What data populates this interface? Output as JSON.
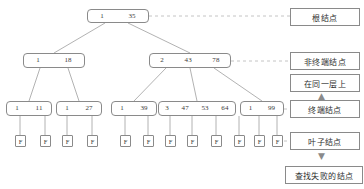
{
  "diagram": {
    "colors": {
      "node_border": "#8a8a8a",
      "edge": "#9a9a9a",
      "dashed": "#b0b0b0",
      "text": "#3b3b3b",
      "background": "#ffffff"
    },
    "root": {
      "id": "root",
      "cells": [
        "1",
        "35"
      ],
      "x": 87,
      "y": 9,
      "w": 62,
      "h": 14
    },
    "internal_nodes": [
      {
        "id": "n-left",
        "cells": [
          "1",
          "18"
        ],
        "x": 23,
        "y": 53,
        "w": 62,
        "h": 15
      },
      {
        "id": "n-right",
        "cells": [
          "2",
          "43",
          "78"
        ],
        "x": 149,
        "y": 53,
        "w": 82,
        "h": 15
      }
    ],
    "terminal_nodes": [
      {
        "id": "t1",
        "cells": [
          "1",
          "11"
        ],
        "x": 6,
        "y": 101,
        "w": 46,
        "h": 15
      },
      {
        "id": "t2",
        "cells": [
          "1",
          "27"
        ],
        "x": 56,
        "y": 101,
        "w": 46,
        "h": 15
      },
      {
        "id": "t3",
        "cells": [
          "1",
          "39"
        ],
        "x": 111,
        "y": 101,
        "w": 46,
        "h": 15
      },
      {
        "id": "t4",
        "cells": [
          "3",
          "47",
          "53",
          "64"
        ],
        "x": 158,
        "y": 101,
        "w": 78,
        "h": 15
      },
      {
        "id": "t5",
        "cells": [
          "1",
          "99"
        ],
        "x": 240,
        "y": 101,
        "w": 44,
        "h": 15
      }
    ],
    "leaf_label": "F",
    "leaves": [
      {
        "id": "f1",
        "x": 15,
        "y": 135
      },
      {
        "id": "f2",
        "x": 40,
        "y": 135
      },
      {
        "id": "f3",
        "x": 62,
        "y": 135
      },
      {
        "id": "f4",
        "x": 87,
        "y": 135
      },
      {
        "id": "f5",
        "x": 120,
        "y": 135
      },
      {
        "id": "f6",
        "x": 143,
        "y": 135
      },
      {
        "id": "f7",
        "x": 165,
        "y": 135
      },
      {
        "id": "f8",
        "x": 187,
        "y": 135
      },
      {
        "id": "f9",
        "x": 211,
        "y": 135
      },
      {
        "id": "f10",
        "x": 234,
        "y": 135
      },
      {
        "id": "f11",
        "x": 254,
        "y": 135
      },
      {
        "id": "f12",
        "x": 272,
        "y": 135
      }
    ],
    "annotations": [
      {
        "id": "ann-root",
        "text": "根结点",
        "x": 290,
        "y": 8,
        "w": 70,
        "h": 18
      },
      {
        "id": "ann-nonterm",
        "text": "非终端结点",
        "x": 290,
        "y": 52,
        "w": 70,
        "h": 18
      },
      {
        "id": "ann-samelevel",
        "text": "在同一层上",
        "x": 290,
        "y": 74,
        "w": 70,
        "h": 18
      },
      {
        "id": "ann-terminal",
        "text": "终端结点",
        "x": 290,
        "y": 100,
        "w": 70,
        "h": 18
      },
      {
        "id": "ann-leaf",
        "text": "叶子结点",
        "x": 290,
        "y": 132,
        "w": 70,
        "h": 18
      },
      {
        "id": "ann-fail",
        "text": "查找失败的结点",
        "x": 285,
        "y": 166,
        "w": 78,
        "h": 18
      }
    ],
    "arrows": [
      {
        "id": "arrow-up",
        "glyph": "▲",
        "x": 318,
        "y": 93
      },
      {
        "id": "arrow-down",
        "glyph": "▼",
        "x": 318,
        "y": 152
      }
    ]
  }
}
